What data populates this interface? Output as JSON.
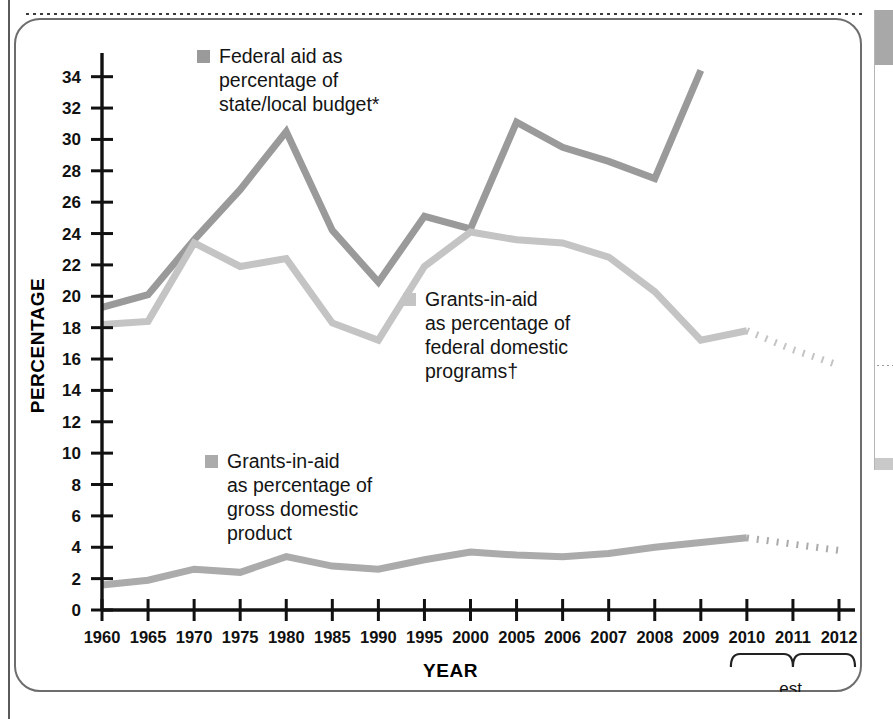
{
  "page": {
    "top_divider": "dotted-rule",
    "side_panel": {
      "present": true,
      "header_color": "#a8a8a8"
    }
  },
  "chart_data": {
    "type": "line",
    "title": "",
    "xlabel": "YEAR",
    "ylabel": "PERCENTAGE",
    "ylim": [
      0,
      35
    ],
    "ytick_step": 2,
    "grid": false,
    "legend_position": "inside-plot",
    "yticks": [
      "0",
      "2",
      "4",
      "6",
      "8",
      "10",
      "12",
      "14",
      "16",
      "18",
      "20",
      "22",
      "24",
      "26",
      "28",
      "30",
      "32",
      "34"
    ],
    "categories": [
      "1960",
      "1965",
      "1970",
      "1975",
      "1980",
      "1985",
      "1990",
      "1995",
      "2000",
      "2005",
      "2006",
      "2007",
      "2008",
      "2009",
      "2010",
      "2011",
      "2012"
    ],
    "estimate_years": [
      "2010",
      "2011",
      "2012"
    ],
    "estimate_bracket_label": "est.",
    "series": [
      {
        "name": "Federal aid as percentage of state/local budget*",
        "short_name": "federal-aid-state-local",
        "color": "#9a9a9a",
        "values": [
          19.3,
          20.1,
          23.6,
          26.8,
          30.5,
          24.2,
          20.9,
          25.1,
          24.3,
          31.1,
          29.5,
          28.6,
          27.5,
          34.4,
          null,
          null,
          null
        ],
        "estimate_values": []
      },
      {
        "name": "Grants-in-aid as percentage of federal domestic programs†",
        "short_name": "grants-federal-domestic-programs",
        "color": "#c4c4c4",
        "values": [
          18.2,
          18.4,
          23.4,
          21.9,
          22.4,
          18.3,
          17.2,
          21.9,
          24.1,
          23.6,
          23.4,
          22.5,
          20.3,
          17.2,
          17.8,
          null,
          null
        ],
        "estimate_values": [
          null,
          null,
          null,
          null,
          null,
          null,
          null,
          null,
          null,
          null,
          null,
          null,
          null,
          null,
          17.8,
          16.6,
          15.6
        ]
      },
      {
        "name": "Grants-in-aid as percentage of gross domestic product",
        "short_name": "grants-gross-domestic-product",
        "color": "#ababab",
        "values": [
          1.6,
          1.9,
          2.6,
          2.4,
          3.4,
          2.8,
          2.6,
          3.2,
          3.7,
          3.5,
          3.4,
          3.6,
          4.0,
          4.3,
          4.6,
          null,
          null
        ],
        "estimate_values": [
          null,
          null,
          null,
          null,
          null,
          null,
          null,
          null,
          null,
          null,
          null,
          null,
          null,
          null,
          4.6,
          4.2,
          3.8
        ]
      }
    ]
  },
  "legends": [
    {
      "id": "federal-aid",
      "color": "#9a9a9a",
      "label": "Federal aid as\npercentage of\nstate/local budget*"
    },
    {
      "id": "federal-programs",
      "color": "#c4c4c4",
      "label": "Grants-in-aid\nas percentage of\nfederal domestic\nprograms†"
    },
    {
      "id": "gdp",
      "color": "#ababab",
      "label": "Grants-in-aid\nas percentage of\ngross domestic\nproduct"
    }
  ],
  "axis": {
    "y_title": "PERCENTAGE",
    "x_title": "YEAR",
    "est_label": "est."
  }
}
